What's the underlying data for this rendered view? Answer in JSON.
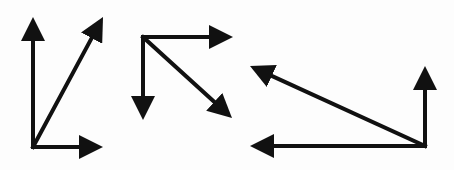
{
  "diagram": {
    "type": "vector-diagrams",
    "background": "#fdfdfd",
    "stroke_color": "#111111",
    "stroke_width": 4,
    "groups": [
      {
        "name": "group-1",
        "origin": [
          33,
          147
        ],
        "arrows": [
          {
            "name": "vertical-up",
            "from": [
              33,
              147
            ],
            "to": [
              33,
              17
            ]
          },
          {
            "name": "diagonal-up-right",
            "from": [
              33,
              147
            ],
            "to": [
              103,
              17
            ]
          },
          {
            "name": "horizontal-right",
            "from": [
              33,
              147
            ],
            "to": [
              103,
              147
            ]
          }
        ]
      },
      {
        "name": "group-2",
        "origin": [
          143,
          37
        ],
        "arrows": [
          {
            "name": "horizontal-right",
            "from": [
              143,
              37
            ],
            "to": [
              233,
              37
            ]
          },
          {
            "name": "vertical-down",
            "from": [
              143,
              37
            ],
            "to": [
              143,
              120
            ]
          },
          {
            "name": "diagonal-down-right",
            "from": [
              143,
              37
            ],
            "to": [
              232,
              118
            ]
          }
        ]
      },
      {
        "name": "group-3",
        "origin": [
          425,
          146
        ],
        "arrows": [
          {
            "name": "vertical-up",
            "from": [
              425,
              146
            ],
            "to": [
              425,
              66
            ]
          },
          {
            "name": "diagonal-up-left",
            "from": [
              425,
              146
            ],
            "to": [
              250,
              66
            ]
          },
          {
            "name": "horizontal-left",
            "from": [
              425,
              146
            ],
            "to": [
              250,
              146
            ]
          }
        ]
      }
    ]
  }
}
